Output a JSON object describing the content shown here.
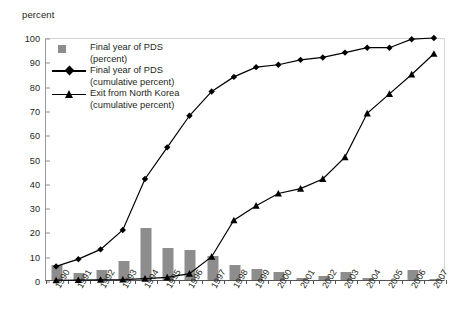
{
  "axis_title": "percent",
  "legend": {
    "items": [
      {
        "key": "square-swatch",
        "line1": "Final year of PDS",
        "line2": "(percent)"
      },
      {
        "key": "diamond-line",
        "line1": "Final year of PDS",
        "line2": "(cumulative percent)"
      },
      {
        "key": "triangle-line",
        "line1": "Exit from North Korea",
        "line2": "(cumulative percent)"
      }
    ]
  },
  "chart_data": {
    "type": "bar",
    "title": "",
    "subtitle": "",
    "xlabel": "",
    "ylabel": "percent",
    "ylim": [
      0,
      100
    ],
    "ytick_step": 10,
    "yticks": [
      0,
      10,
      20,
      30,
      40,
      50,
      60,
      70,
      80,
      90,
      100
    ],
    "grid": false,
    "legend_position": "top-left",
    "categories": [
      "1990",
      "1991",
      "1992",
      "1993",
      "1994",
      "1995",
      "1996",
      "1997",
      "1998",
      "1999",
      "2000",
      "2001",
      "2002",
      "2003",
      "2004",
      "2005",
      "2006",
      "2007"
    ],
    "series": [
      {
        "name": "Final year of PDS (percent)",
        "type": "bar",
        "color": "#8d8d8d",
        "values": [
          6,
          3,
          4,
          8,
          21.5,
          13,
          12.5,
          10,
          6,
          4.5,
          3.5,
          1,
          1.5,
          3.5,
          1,
          0,
          4,
          0.5
        ]
      },
      {
        "name": "Final year of PDS (cumulative percent)",
        "type": "line",
        "marker": "diamond",
        "color": "#000000",
        "values": [
          6,
          9,
          13,
          21,
          42,
          55,
          68,
          78,
          84,
          88,
          89,
          91,
          92,
          94,
          96,
          96,
          99.5,
          100
        ]
      },
      {
        "name": "Exit from North Korea (cumulative percent)",
        "type": "line",
        "marker": "triangle",
        "color": "#000000",
        "values": [
          0.3,
          0.4,
          0.5,
          0.6,
          1,
          1.5,
          3,
          10,
          25,
          31,
          36,
          38,
          42,
          51,
          69,
          77,
          85,
          93.5
        ]
      }
    ]
  }
}
